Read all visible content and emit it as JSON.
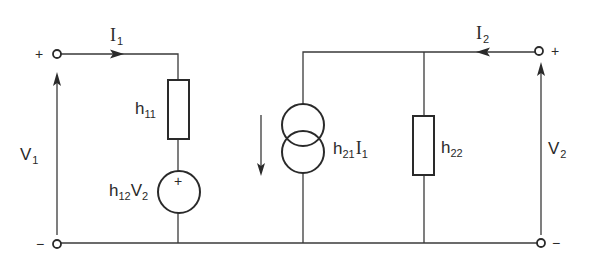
{
  "diagram": {
    "title": "",
    "type": "h-parameter two-port equivalent circuit",
    "colors": {
      "ink": "#2a2a2a",
      "background": "#ffffff"
    },
    "port1": {
      "plus_sign": "+",
      "minus_sign": "−",
      "current_label": "I",
      "current_sub": "1",
      "voltage_label": "V",
      "voltage_sub": "1"
    },
    "port2": {
      "plus_sign": "+",
      "minus_sign": "−",
      "current_label": "I",
      "current_sub": "2",
      "voltage_label": "V",
      "voltage_sub": "2"
    },
    "components": {
      "h11": {
        "label": "h",
        "sub": "11"
      },
      "h12_source": {
        "label_h": "h",
        "sub_h": "12",
        "label_v": "V",
        "sub_v": "2",
        "polarity": "+"
      },
      "h21_source": {
        "label_h": "h",
        "sub_h": "21",
        "label_i": "I",
        "sub_i": "1"
      },
      "h22": {
        "label": "h",
        "sub": "22"
      }
    }
  }
}
